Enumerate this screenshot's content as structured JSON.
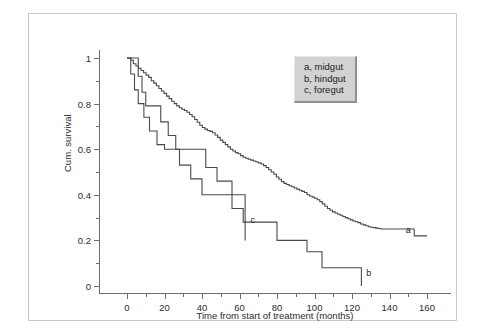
{
  "figure": {
    "background": "#ffffff",
    "frame_color": "#c9c9c9",
    "axis_color": "#6f6f6f",
    "curve_color": "#4a4a4a"
  },
  "legend": {
    "position": "top-right-inside",
    "background": "#d2d2d2",
    "entries": [
      {
        "label": "a, midgut"
      },
      {
        "label": "b, hindgut"
      },
      {
        "label": "c, foregut"
      }
    ]
  },
  "annotations": [
    {
      "name": "curve-label-a",
      "text": "a",
      "x": 150,
      "y": 0.245
    },
    {
      "name": "curve-label-b",
      "text": "b",
      "x": 129,
      "y": 0.055
    },
    {
      "name": "curve-label-c",
      "text": "c",
      "x": 67,
      "y": 0.29
    }
  ],
  "axes": {
    "y_ticks_major": [
      "0",
      "0.2",
      "0.4",
      "0.6",
      "0.8",
      "1"
    ],
    "y_tick_values": [
      0,
      0.2,
      0.4,
      0.6,
      0.8,
      1
    ],
    "y_ticks_minor": [
      0.1,
      0.3,
      0.5,
      0.7,
      0.9
    ],
    "x_ticks_major": [
      "0",
      "20",
      "40",
      "60",
      "80",
      "100",
      "120",
      "140",
      "160"
    ],
    "x_tick_values": [
      0,
      20,
      40,
      60,
      80,
      100,
      120,
      140,
      160
    ],
    "x_ticks_minor": [
      10,
      30,
      50,
      70,
      90,
      110,
      130,
      150
    ]
  },
  "chart_data": {
    "type": "line",
    "title": "",
    "subtitle": "",
    "xlabel": "Time from start of treatment (months)",
    "ylabel": "Cum. survival",
    "xlim": [
      0,
      165
    ],
    "ylim": [
      0,
      1.04
    ],
    "grid": false,
    "legend_position": "upper right",
    "plot_style": "kaplan-meier step (stepAfter)",
    "series": [
      {
        "name": "a, midgut",
        "letter": "a",
        "points": [
          [
            0,
            1.0
          ],
          [
            3,
            0.99
          ],
          [
            5,
            0.975
          ],
          [
            7,
            0.965
          ],
          [
            9,
            0.955
          ],
          [
            11,
            0.945
          ],
          [
            13,
            0.935
          ],
          [
            15,
            0.925
          ],
          [
            17,
            0.915
          ],
          [
            19,
            0.9
          ],
          [
            21,
            0.89
          ],
          [
            23,
            0.878
          ],
          [
            25,
            0.866
          ],
          [
            27,
            0.855
          ],
          [
            29,
            0.845
          ],
          [
            31,
            0.833
          ],
          [
            33,
            0.822
          ],
          [
            35,
            0.81
          ],
          [
            37,
            0.8
          ],
          [
            39,
            0.79
          ],
          [
            41,
            0.782
          ],
          [
            43,
            0.775
          ],
          [
            45,
            0.77
          ],
          [
            47,
            0.762
          ],
          [
            49,
            0.752
          ],
          [
            51,
            0.742
          ],
          [
            53,
            0.73
          ],
          [
            55,
            0.718
          ],
          [
            57,
            0.705
          ],
          [
            59,
            0.695
          ],
          [
            61,
            0.688
          ],
          [
            63,
            0.682
          ],
          [
            65,
            0.678
          ],
          [
            67,
            0.672
          ],
          [
            69,
            0.662
          ],
          [
            71,
            0.652
          ],
          [
            73,
            0.64
          ],
          [
            75,
            0.63
          ],
          [
            77,
            0.62
          ],
          [
            79,
            0.61
          ],
          [
            81,
            0.6
          ],
          [
            83,
            0.592
          ],
          [
            85,
            0.585
          ],
          [
            87,
            0.58
          ],
          [
            89,
            0.572
          ],
          [
            91,
            0.565
          ],
          [
            93,
            0.56
          ],
          [
            95,
            0.556
          ],
          [
            97,
            0.552
          ],
          [
            99,
            0.548
          ],
          [
            101,
            0.544
          ],
          [
            103,
            0.54
          ],
          [
            105,
            0.535
          ],
          [
            107,
            0.528
          ],
          [
            109,
            0.52
          ],
          [
            111,
            0.51
          ],
          [
            113,
            0.5
          ],
          [
            115,
            0.49
          ],
          [
            117,
            0.478
          ],
          [
            119,
            0.468
          ],
          [
            121,
            0.458
          ],
          [
            123,
            0.45
          ],
          [
            125,
            0.445
          ],
          [
            127,
            0.44
          ],
          [
            129,
            0.435
          ],
          [
            131,
            0.43
          ],
          [
            133,
            0.425
          ],
          [
            135,
            0.42
          ],
          [
            137,
            0.415
          ],
          [
            139,
            0.41
          ],
          [
            141,
            0.4
          ],
          [
            143,
            0.395
          ],
          [
            145,
            0.39
          ],
          [
            147,
            0.385
          ],
          [
            149,
            0.378
          ],
          [
            151,
            0.37
          ],
          [
            153,
            0.36
          ],
          [
            155,
            0.35
          ],
          [
            157,
            0.34
          ],
          [
            159,
            0.332
          ],
          [
            161,
            0.325
          ],
          [
            163,
            0.32
          ],
          [
            165,
            0.315
          ],
          [
            167,
            0.31
          ],
          [
            169,
            0.305
          ],
          [
            171,
            0.3
          ],
          [
            173,
            0.295
          ],
          [
            175,
            0.29
          ],
          [
            177,
            0.285
          ],
          [
            179,
            0.282
          ],
          [
            181,
            0.278
          ],
          [
            183,
            0.272
          ],
          [
            185,
            0.268
          ],
          [
            187,
            0.264
          ],
          [
            189,
            0.26
          ],
          [
            191,
            0.258
          ],
          [
            193,
            0.256
          ],
          [
            195,
            0.254
          ],
          [
            197,
            0.252
          ],
          [
            199,
            0.25
          ],
          [
            201,
            0.25
          ],
          [
            203,
            0.25
          ],
          [
            205,
            0.25
          ],
          [
            207,
            0.25
          ],
          [
            209,
            0.25
          ],
          [
            211,
            0.25
          ],
          [
            213,
            0.25
          ],
          [
            215,
            0.25
          ],
          [
            217,
            0.25
          ],
          [
            219,
            0.25
          ],
          [
            221,
            0.25
          ],
          [
            223,
            0.25
          ],
          [
            225,
            0.22
          ],
          [
            227,
            0.22
          ],
          [
            229,
            0.22
          ],
          [
            231,
            0.22
          ],
          [
            233,
            0.22
          ],
          [
            235,
            0.22
          ]
        ],
        "note": "points listed as [pixel-ordered index, survival]; actual x months given in x_months"
      },
      {
        "name": "b, hindgut",
        "letter": "b",
        "points": [
          [
            0,
            1.0
          ],
          [
            2,
            0.93
          ],
          [
            4,
            0.86
          ],
          [
            6,
            0.8
          ],
          [
            9,
            0.74
          ],
          [
            12,
            0.68
          ],
          [
            16,
            0.62
          ],
          [
            20,
            0.6
          ],
          [
            28,
            0.53
          ],
          [
            34,
            0.47
          ],
          [
            40,
            0.4
          ],
          [
            46,
            0.4
          ],
          [
            56,
            0.34
          ],
          [
            62,
            0.28
          ],
          [
            72,
            0.28
          ],
          [
            80,
            0.2
          ],
          [
            88,
            0.2
          ],
          [
            96,
            0.15
          ],
          [
            104,
            0.08
          ],
          [
            124,
            0.08
          ],
          [
            125,
            0.0
          ]
        ]
      },
      {
        "name": "c, foregut",
        "letter": "c",
        "points": [
          [
            0,
            1.0
          ],
          [
            4,
            1.0
          ],
          [
            6,
            0.92
          ],
          [
            8,
            0.85
          ],
          [
            10,
            0.79
          ],
          [
            14,
            0.79
          ],
          [
            18,
            0.72
          ],
          [
            22,
            0.66
          ],
          [
            26,
            0.6
          ],
          [
            38,
            0.6
          ],
          [
            42,
            0.52
          ],
          [
            48,
            0.46
          ],
          [
            56,
            0.4
          ],
          [
            62,
            0.4
          ],
          [
            63,
            0.2
          ]
        ]
      }
    ]
  }
}
